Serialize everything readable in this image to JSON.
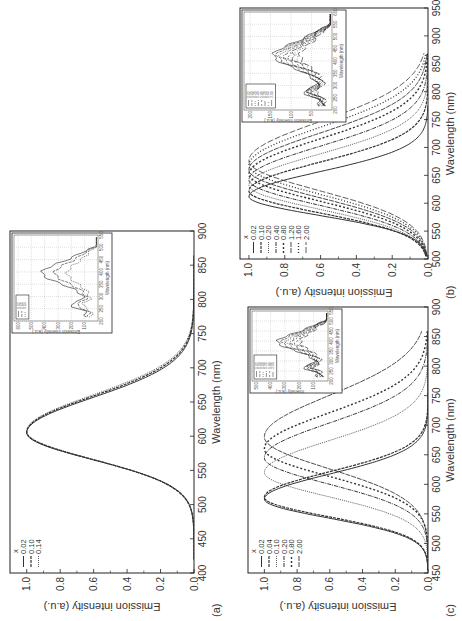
{
  "figure": {
    "panels": [
      {
        "id": "a",
        "label": "(a)",
        "xlabel": "Wavelength (nm)",
        "ylabel": "Emission intensity (a.u.)",
        "legend_title": "x",
        "legend": [
          "0.02",
          "0.10",
          "0.14"
        ],
        "inset": {
          "xlabel": "Wavelength (nm)",
          "ylabel": "Emission intensity (a.u.)",
          "xticks": [
            "200",
            "250",
            "300",
            "350",
            "400",
            "450",
            "500",
            "550"
          ],
          "yticks": [
            "100",
            "200",
            "300",
            "400",
            "500",
            "600"
          ],
          "legend": [
            "0.02",
            "0.10",
            "0.14"
          ]
        }
      },
      {
        "id": "b",
        "label": "(b)",
        "xlabel": "Wavelength (nm)",
        "ylabel": "Emission intensity (a.u.)",
        "legend_title": "x",
        "legend": [
          "0.02",
          "0.10",
          "0.20",
          "0.40",
          "0.80",
          "1.20",
          "1.60",
          "2.00"
        ],
        "inset": {
          "xlabel": "Wavelength (nm)",
          "ylabel": "Emission intensity (a.u.)",
          "xticks": [
            "200",
            "250",
            "300",
            "350",
            "400",
            "450",
            "500",
            "550",
            "600"
          ],
          "yticks": [
            "50",
            "100",
            "150",
            "200"
          ],
          "legend": [
            "0.02",
            "0.10",
            "0.20",
            "0.40",
            "0.80",
            "1.20",
            "1.60",
            "2.00"
          ]
        }
      },
      {
        "id": "c",
        "label": "(c)",
        "xlabel": "Wavelength (nm)",
        "ylabel": "Emission intensity (a.u.)",
        "legend_title": "x",
        "legend": [
          "0.02",
          "0.04",
          "0.10",
          "0.20",
          "0.80",
          "2.00"
        ],
        "inset": {
          "xlabel": "Wavelength (nm)",
          "ylabel": "Intensity (a.u.)",
          "xticks": [
            "200",
            "250",
            "300",
            "350",
            "400",
            "450",
            "500",
            "550"
          ],
          "yticks": [
            "100",
            "200",
            "300",
            "400",
            "500"
          ],
          "legend": [
            "0.02",
            "0.04",
            "0.10",
            "0.20",
            "0.80",
            "2.00"
          ]
        }
      }
    ]
  },
  "chart_data": [
    {
      "type": "line",
      "title": "(a)",
      "xlabel": "Wavelength (nm)",
      "ylabel": "Emission intensity (a.u.)",
      "xlim": [
        400,
        900
      ],
      "ylim": [
        0,
        1.1
      ],
      "xticks": [
        400,
        450,
        500,
        550,
        600,
        650,
        700,
        750,
        800,
        850,
        900
      ],
      "yticks": [
        0.0,
        0.2,
        0.4,
        0.6,
        0.8,
        1.0
      ],
      "legend_title": "x",
      "legend_position": "upper left",
      "series": [
        {
          "name": "0.02",
          "peak_nm": 605,
          "fwhm_nm": 110,
          "x_range": [
            420,
            865
          ]
        },
        {
          "name": "0.10",
          "peak_nm": 606,
          "fwhm_nm": 112,
          "x_range": [
            420,
            865
          ]
        },
        {
          "name": "0.14",
          "peak_nm": 607,
          "fwhm_nm": 114,
          "x_range": [
            420,
            865
          ]
        }
      ],
      "inset": {
        "type": "line",
        "xlabel": "Wavelength (nm)",
        "ylabel": "Emission intensity (a.u.)",
        "xlim": [
          200,
          550
        ],
        "ylim": [
          0,
          650
        ],
        "note": "excitation spectra, peak near 410 nm"
      }
    },
    {
      "type": "line",
      "title": "(b)",
      "xlabel": "Wavelength (nm)",
      "ylabel": "Emission intensity (a.u.)",
      "xlim": [
        500,
        950
      ],
      "ylim": [
        0,
        1.05
      ],
      "xticks": [
        500,
        550,
        600,
        650,
        700,
        750,
        800,
        850,
        900,
        950
      ],
      "yticks": [
        0.0,
        0.2,
        0.4,
        0.6,
        0.8,
        1.0
      ],
      "legend_title": "x",
      "legend_position": "upper left",
      "series": [
        {
          "name": "0.02",
          "peak_nm": 612,
          "fwhm_nm": 95,
          "x_range": [
            505,
            775
          ]
        },
        {
          "name": "0.10",
          "peak_nm": 622,
          "fwhm_nm": 110,
          "x_range": [
            505,
            870
          ]
        },
        {
          "name": "0.20",
          "peak_nm": 632,
          "fwhm_nm": 120,
          "x_range": [
            505,
            870
          ]
        },
        {
          "name": "0.40",
          "peak_nm": 642,
          "fwhm_nm": 128,
          "x_range": [
            505,
            870
          ]
        },
        {
          "name": "0.80",
          "peak_nm": 652,
          "fwhm_nm": 135,
          "x_range": [
            505,
            870
          ]
        },
        {
          "name": "1.20",
          "peak_nm": 660,
          "fwhm_nm": 140,
          "x_range": [
            505,
            870
          ]
        },
        {
          "name": "1.60",
          "peak_nm": 668,
          "fwhm_nm": 145,
          "x_range": [
            505,
            870
          ]
        },
        {
          "name": "2.00",
          "peak_nm": 676,
          "fwhm_nm": 150,
          "x_range": [
            505,
            870
          ]
        }
      ],
      "inset": {
        "type": "line",
        "xlabel": "Wavelength (nm)",
        "ylabel": "Emission intensity (a.u.)",
        "xlim": [
          200,
          600
        ],
        "ylim": [
          0,
          220
        ],
        "note": "excitation spectra"
      }
    },
    {
      "type": "line",
      "title": "(c)",
      "xlabel": "Wavelength (nm)",
      "ylabel": "Emission intensity (a.u.)",
      "xlim": [
        450,
        900
      ],
      "ylim": [
        0,
        1.1
      ],
      "xticks": [
        450,
        500,
        550,
        600,
        650,
        700,
        750,
        800,
        850,
        900
      ],
      "yticks": [
        0.0,
        0.2,
        0.4,
        0.6,
        0.8,
        1.0
      ],
      "legend_title": "x",
      "legend_position": "upper left",
      "series": [
        {
          "name": "0.02",
          "peak_nm": 575,
          "fwhm_nm": 90,
          "x_range": [
            455,
            860
          ]
        },
        {
          "name": "0.04",
          "peak_nm": 578,
          "fwhm_nm": 92,
          "x_range": [
            455,
            860
          ]
        },
        {
          "name": "0.10",
          "peak_nm": 620,
          "fwhm_nm": 115,
          "x_range": [
            455,
            860
          ]
        },
        {
          "name": "0.20",
          "peak_nm": 645,
          "fwhm_nm": 125,
          "x_range": [
            455,
            860
          ]
        },
        {
          "name": "0.80",
          "peak_nm": 660,
          "fwhm_nm": 130,
          "x_range": [
            455,
            860
          ]
        },
        {
          "name": "2.00",
          "peak_nm": 680,
          "fwhm_nm": 150,
          "x_range": [
            455,
            860
          ]
        }
      ],
      "inset": {
        "type": "line",
        "xlabel": "Wavelength (nm)",
        "ylabel": "Intensity (a.u.)",
        "xlim": [
          200,
          550
        ],
        "ylim": [
          0,
          550
        ],
        "note": "excitation spectra"
      }
    }
  ]
}
